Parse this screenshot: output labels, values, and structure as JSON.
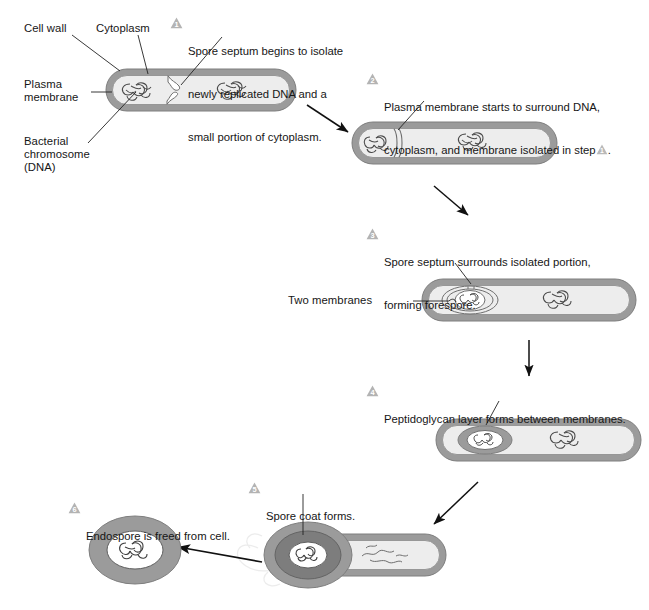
{
  "diagram": {
    "type": "biological-process-diagram",
    "colors": {
      "cell_wall": "#9b9b9b",
      "cell_interior": "#ededed",
      "spore_coat": "#7d7d7d",
      "badge": "#b3b3b3",
      "badge_text": "#ffffff",
      "outline": "#6e6e6e",
      "dna": "#4a4a4a",
      "arrow": "#111111",
      "leader": "#222222",
      "text": "#161616"
    }
  },
  "labels": {
    "cell_wall": "Cell wall",
    "cytoplasm": "Cytoplasm",
    "plasma_membrane_line1": "Plasma",
    "plasma_membrane_line2": "membrane",
    "bacterial_chromosome_line1": "Bacterial",
    "bacterial_chromosome_line2": "chromosome",
    "bacterial_chromosome_line3": "(DNA)",
    "two_membranes": "Two membranes"
  },
  "steps": [
    {
      "number": "1",
      "lines": [
        "Spore septum begins to isolate",
        "newly replicated DNA and a",
        "small portion of cytoplasm."
      ]
    },
    {
      "number": "2",
      "lines": [
        "Plasma membrane starts to surround DNA,",
        "cytoplasm, and membrane isolated in step"
      ],
      "inline_ref_number": "1",
      "trailing": "."
    },
    {
      "number": "3",
      "lines": [
        "Spore septum surrounds isolated portion,",
        "forming forespore."
      ]
    },
    {
      "number": "4",
      "lines": [
        "Peptidoglycan layer forms between membranes."
      ]
    },
    {
      "number": "5",
      "lines": [
        "Spore coat forms."
      ]
    },
    {
      "number": "6",
      "lines": [
        "Endospore is freed from cell."
      ]
    }
  ]
}
